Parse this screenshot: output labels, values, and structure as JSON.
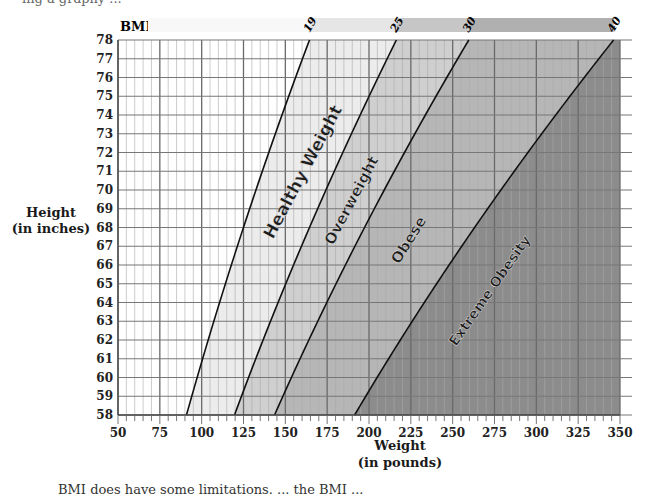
{
  "page": {
    "top_crop_text": "ing a graphy ...",
    "bottom_crop_text": "BMI does have some limitations. ... the BMI ... "
  },
  "chart_data": {
    "type": "area",
    "title": "BMI",
    "xlabel": "Weight\n(in pounds)",
    "xlabel_line1": "Weight",
    "xlabel_line2": "(in pounds)",
    "ylabel_line1": "Height",
    "ylabel_line2": "(in inches)",
    "xlim": [
      50,
      350
    ],
    "ylim": [
      58,
      78
    ],
    "x_ticks": [
      50,
      75,
      100,
      125,
      150,
      175,
      200,
      225,
      250,
      275,
      300,
      325,
      350
    ],
    "y_ticks": [
      58,
      59,
      60,
      61,
      62,
      63,
      64,
      65,
      66,
      67,
      68,
      69,
      70,
      71,
      72,
      73,
      74,
      75,
      76,
      77,
      78
    ],
    "grid": true,
    "bmi_boundaries": [
      19,
      25,
      30,
      40
    ],
    "boundary_formula": "weight_lb = BMI * height_in^2 / 703",
    "boundary_points": {
      "19": {
        "at_58in": 90,
        "at_78in": 164
      },
      "25": {
        "at_58in": 119,
        "at_78in": 216
      },
      "30": {
        "at_58in": 143,
        "at_78in": 260
      },
      "40": {
        "at_58in": 191,
        "at_78in": 346
      }
    },
    "regions": [
      {
        "name": "Underweight",
        "label": "",
        "bmi_range": [
          0,
          19
        ],
        "color": "#ffffff"
      },
      {
        "name": "Healthy Weight",
        "label": "Healthy Weight",
        "bmi_range": [
          19,
          25
        ],
        "color": "#ececec"
      },
      {
        "name": "Overweight",
        "label": "Overweight",
        "bmi_range": [
          25,
          30
        ],
        "color": "#cfcfcf"
      },
      {
        "name": "Obese",
        "label": "Obese",
        "bmi_range": [
          30,
          40
        ],
        "color": "#b6b6b6"
      },
      {
        "name": "Extreme Obesity",
        "label": "Extreme Obesity",
        "bmi_range": [
          40,
          100
        ],
        "color": "#8c8c8c"
      }
    ],
    "legend_bar_labels": [
      "19",
      "25",
      "30",
      "40"
    ]
  }
}
